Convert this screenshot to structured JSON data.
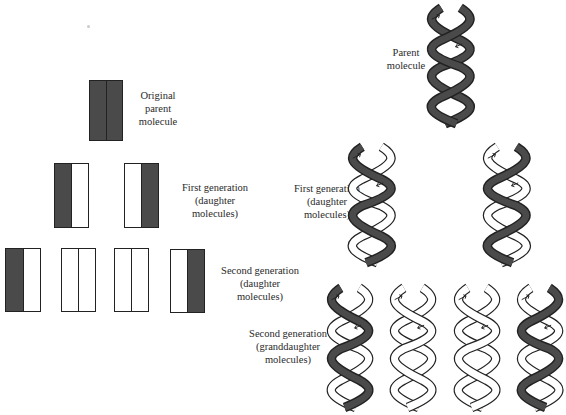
{
  "colors": {
    "old_strand": "#4a4a4a",
    "new_strand": "#ffffff",
    "outline": "#222222"
  },
  "left_panel": {
    "generations": [
      {
        "label": "Original\nparent\nmolecule",
        "molecules": [
          [
            "old",
            "old"
          ]
        ]
      },
      {
        "label": "First generation\n(daughter\nmolecules)",
        "molecules": [
          [
            "old",
            "new"
          ],
          [
            "new",
            "old"
          ]
        ]
      },
      {
        "label": "Second generation\n(daughter\nmolecules)",
        "molecules": [
          [
            "old",
            "new"
          ],
          [
            "new",
            "new"
          ],
          [
            "new",
            "new"
          ],
          [
            "new",
            "old"
          ]
        ]
      }
    ]
  },
  "right_panel": {
    "generations": [
      {
        "label": "Parent\nmolecule",
        "helices": [
          [
            "old",
            "old"
          ]
        ]
      },
      {
        "label": "First generation\n(daughter\nmolecules)",
        "helices": [
          [
            "old",
            "new"
          ],
          [
            "new",
            "old"
          ]
        ]
      },
      {
        "label": "Second generation\n(granddaughter\nmolecules)",
        "helices": [
          [
            "old",
            "new"
          ],
          [
            "new",
            "new"
          ],
          [
            "new",
            "new"
          ],
          [
            "new",
            "old"
          ]
        ]
      }
    ]
  }
}
